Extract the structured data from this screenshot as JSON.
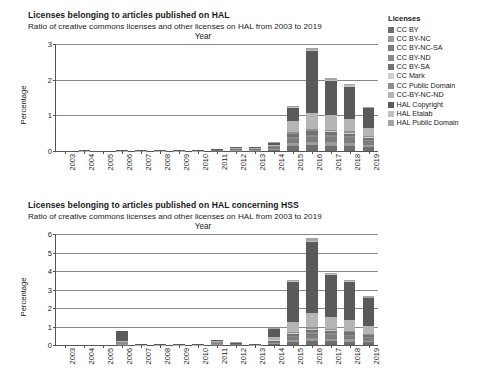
{
  "legend": {
    "title": "Licenses",
    "items": [
      {
        "label": "CC BY",
        "color": "#6e6e6e"
      },
      {
        "label": "CC BY-NC",
        "color": "#9a9a9a"
      },
      {
        "label": "CC BY-NC-SA",
        "color": "#7d7d7d"
      },
      {
        "label": "CC BY-ND",
        "color": "#8a8a8a"
      },
      {
        "label": "CC BY-SA",
        "color": "#727272"
      },
      {
        "label": "CC Mark",
        "color": "#cfcfcf"
      },
      {
        "label": "CC Public Domain",
        "color": "#8f8f8f"
      },
      {
        "label": "CC-BY-NC-ND",
        "color": "#b5b5b5"
      },
      {
        "label": "HAL Copyright",
        "color": "#5a5a5a"
      },
      {
        "label": "HAL Etalab",
        "color": "#c2c2c2"
      },
      {
        "label": "HAL Public Domain",
        "color": "#a5a5a5"
      }
    ]
  },
  "charts": [
    {
      "title": "Licenses belonging to articles published on HAL",
      "subtitle": "Ratio of creative commons licenses and other licenses on HAL from 2003 to 2019",
      "xlabel": "Year",
      "ylabel": "Percentage"
    },
    {
      "title": "Licenses belonging to articles published on HAL concerning HSS",
      "subtitle": "Ratio of creative commons licenses and other licenses on HAL from 2003 to 2019",
      "xlabel": "Year",
      "ylabel": "Percentage"
    }
  ],
  "chart_data": [
    {
      "type": "bar",
      "stacked": true,
      "title": "Licenses belonging to articles published on HAL",
      "subtitle": "Ratio of creative commons licenses and other licenses on HAL from 2003 to 2019",
      "xlabel": "Year",
      "ylabel": "Percentage",
      "ylim": [
        0,
        3
      ],
      "yticks": [
        0,
        1,
        2,
        3
      ],
      "grid": true,
      "legend_position": "right",
      "categories": [
        "2003",
        "2004",
        "2005",
        "2006",
        "2007",
        "2008",
        "2009",
        "2010",
        "2011",
        "2012",
        "2013",
        "2014",
        "2015",
        "2016",
        "2017",
        "2018",
        "2019"
      ],
      "totals": [
        0.01,
        0.02,
        0.01,
        0.02,
        0.02,
        0.02,
        0.03,
        0.02,
        0.05,
        0.09,
        0.1,
        0.24,
        1.27,
        2.9,
        2.06,
        1.89,
        1.24
      ],
      "series": [
        {
          "name": "CC BY",
          "values": [
            0.0,
            0.0,
            0.0,
            0.0,
            0.0,
            0.0,
            0.0,
            0.0,
            0.01,
            0.01,
            0.01,
            0.03,
            0.13,
            0.16,
            0.15,
            0.14,
            0.11
          ]
        },
        {
          "name": "CC BY-NC",
          "values": [
            0.0,
            0.0,
            0.0,
            0.0,
            0.0,
            0.0,
            0.0,
            0.0,
            0.0,
            0.01,
            0.01,
            0.02,
            0.09,
            0.1,
            0.1,
            0.09,
            0.07
          ]
        },
        {
          "name": "CC BY-NC-SA",
          "values": [
            0.0,
            0.0,
            0.0,
            0.0,
            0.0,
            0.0,
            0.0,
            0.0,
            0.01,
            0.01,
            0.01,
            0.03,
            0.12,
            0.14,
            0.14,
            0.13,
            0.09
          ]
        },
        {
          "name": "CC BY-ND",
          "values": [
            0.0,
            0.0,
            0.0,
            0.0,
            0.0,
            0.0,
            0.0,
            0.0,
            0.0,
            0.0,
            0.0,
            0.01,
            0.05,
            0.06,
            0.06,
            0.05,
            0.04
          ]
        },
        {
          "name": "CC BY-SA",
          "values": [
            0.0,
            0.0,
            0.0,
            0.0,
            0.0,
            0.0,
            0.0,
            0.0,
            0.0,
            0.01,
            0.01,
            0.02,
            0.08,
            0.09,
            0.09,
            0.08,
            0.06
          ]
        },
        {
          "name": "CC Mark",
          "values": [
            0.0,
            0.0,
            0.0,
            0.0,
            0.0,
            0.0,
            0.0,
            0.0,
            0.0,
            0.0,
            0.0,
            0.0,
            0.02,
            0.02,
            0.02,
            0.02,
            0.01
          ]
        },
        {
          "name": "CC Public Domain",
          "values": [
            0.0,
            0.0,
            0.0,
            0.0,
            0.0,
            0.0,
            0.0,
            0.0,
            0.0,
            0.0,
            0.0,
            0.01,
            0.04,
            0.05,
            0.04,
            0.04,
            0.03
          ]
        },
        {
          "name": "CC-BY-NC-ND",
          "values": [
            0.0,
            0.01,
            0.0,
            0.01,
            0.01,
            0.01,
            0.01,
            0.01,
            0.01,
            0.02,
            0.02,
            0.05,
            0.3,
            0.45,
            0.4,
            0.36,
            0.24
          ]
        },
        {
          "name": "HAL Copyright",
          "values": [
            0.01,
            0.01,
            0.01,
            0.01,
            0.01,
            0.01,
            0.02,
            0.01,
            0.02,
            0.03,
            0.03,
            0.06,
            0.38,
            1.73,
            0.97,
            0.9,
            0.54
          ]
        },
        {
          "name": "HAL Etalab",
          "values": [
            0.0,
            0.0,
            0.0,
            0.0,
            0.0,
            0.0,
            0.0,
            0.0,
            0.0,
            0.0,
            0.0,
            0.0,
            0.02,
            0.04,
            0.03,
            0.03,
            0.02
          ]
        },
        {
          "name": "HAL Public Domain",
          "values": [
            0.0,
            0.0,
            0.0,
            0.0,
            0.0,
            0.0,
            0.0,
            0.0,
            0.0,
            0.0,
            0.0,
            0.01,
            0.04,
            0.06,
            0.06,
            0.05,
            0.03
          ]
        }
      ]
    },
    {
      "type": "bar",
      "stacked": true,
      "title": "Licenses belonging to articles published on HAL concerning HSS",
      "subtitle": "Ratio of creative commons licenses and other licenses on HAL from 2003 to 2019",
      "xlabel": "Year",
      "ylabel": "Percentage",
      "ylim": [
        0,
        6
      ],
      "yticks": [
        0,
        1,
        2,
        3,
        4,
        5,
        6
      ],
      "grid": true,
      "legend_position": "right",
      "categories": [
        "2003",
        "2004",
        "2005",
        "2006",
        "2007",
        "2008",
        "2009",
        "2010",
        "2011",
        "2012",
        "2013",
        "2014",
        "2015",
        "2016",
        "2017",
        "2018",
        "2019"
      ],
      "totals": [
        0.01,
        0.01,
        0.01,
        0.65,
        0.02,
        0.02,
        0.02,
        0.02,
        0.18,
        0.07,
        0.04,
        0.85,
        3.52,
        5.78,
        3.92,
        3.53,
        2.62
      ],
      "series": [
        {
          "name": "CC BY",
          "values": [
            0.0,
            0.0,
            0.0,
            0.01,
            0.0,
            0.0,
            0.0,
            0.0,
            0.02,
            0.01,
            0.0,
            0.06,
            0.16,
            0.22,
            0.2,
            0.18,
            0.14
          ]
        },
        {
          "name": "CC BY-NC",
          "values": [
            0.0,
            0.0,
            0.0,
            0.01,
            0.0,
            0.0,
            0.0,
            0.0,
            0.01,
            0.0,
            0.0,
            0.04,
            0.11,
            0.15,
            0.14,
            0.13,
            0.1
          ]
        },
        {
          "name": "CC BY-NC-SA",
          "values": [
            0.0,
            0.0,
            0.0,
            0.01,
            0.0,
            0.0,
            0.0,
            0.0,
            0.02,
            0.01,
            0.0,
            0.06,
            0.17,
            0.23,
            0.21,
            0.19,
            0.14
          ]
        },
        {
          "name": "CC BY-ND",
          "values": [
            0.0,
            0.0,
            0.0,
            0.01,
            0.0,
            0.0,
            0.0,
            0.0,
            0.01,
            0.0,
            0.0,
            0.02,
            0.07,
            0.09,
            0.08,
            0.07,
            0.05
          ]
        },
        {
          "name": "CC BY-SA",
          "values": [
            0.0,
            0.0,
            0.0,
            0.01,
            0.0,
            0.0,
            0.0,
            0.0,
            0.01,
            0.0,
            0.0,
            0.04,
            0.11,
            0.15,
            0.13,
            0.12,
            0.09
          ]
        },
        {
          "name": "CC Mark",
          "values": [
            0.0,
            0.0,
            0.0,
            0.0,
            0.0,
            0.0,
            0.0,
            0.0,
            0.0,
            0.0,
            0.0,
            0.01,
            0.03,
            0.04,
            0.03,
            0.03,
            0.02
          ]
        },
        {
          "name": "CC Public Domain",
          "values": [
            0.0,
            0.0,
            0.0,
            0.01,
            0.0,
            0.0,
            0.0,
            0.0,
            0.01,
            0.0,
            0.0,
            0.02,
            0.06,
            0.08,
            0.07,
            0.06,
            0.05
          ]
        },
        {
          "name": "CC-BY-NC-ND",
          "values": [
            0.0,
            0.0,
            0.0,
            0.05,
            0.01,
            0.01,
            0.01,
            0.01,
            0.03,
            0.01,
            0.01,
            0.14,
            0.55,
            0.8,
            0.66,
            0.58,
            0.42
          ]
        },
        {
          "name": "HAL Copyright",
          "values": [
            0.01,
            0.01,
            0.01,
            0.53,
            0.01,
            0.01,
            0.01,
            0.01,
            0.06,
            0.03,
            0.02,
            0.42,
            2.16,
            3.83,
            2.25,
            2.04,
            1.52
          ]
        },
        {
          "name": "HAL Etalab",
          "values": [
            0.0,
            0.0,
            0.0,
            0.0,
            0.0,
            0.0,
            0.0,
            0.0,
            0.0,
            0.0,
            0.0,
            0.01,
            0.03,
            0.06,
            0.05,
            0.04,
            0.03
          ]
        },
        {
          "name": "HAL Public Domain",
          "values": [
            0.0,
            0.0,
            0.0,
            0.01,
            0.0,
            0.0,
            0.0,
            0.0,
            0.01,
            0.01,
            0.01,
            0.03,
            0.07,
            0.13,
            0.1,
            0.09,
            0.06
          ]
        }
      ]
    }
  ]
}
